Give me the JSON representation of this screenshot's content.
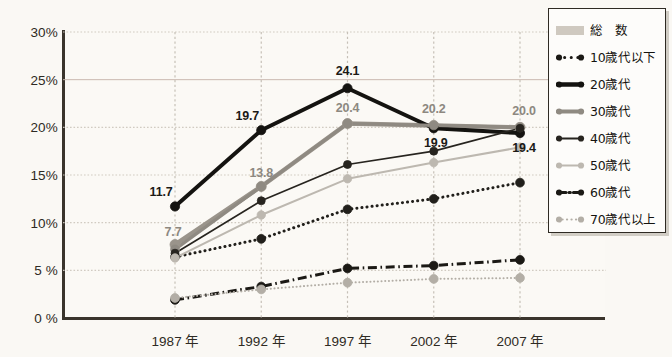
{
  "chart_data": {
    "type": "line",
    "title": "",
    "xlabel": "",
    "ylabel": "",
    "grid": true,
    "legend_position": "right",
    "categories": [
      "1987 年",
      "1992 年",
      "1997 年",
      "2002 年",
      "2007 年"
    ],
    "ylim": [
      0,
      30
    ],
    "yticks": [
      0,
      5,
      10,
      15,
      20,
      25,
      30
    ],
    "ytick_labels": [
      "0 %",
      "5 %",
      "10%",
      "15%",
      "20%",
      "25%",
      "30%"
    ],
    "series": [
      {
        "name": "総　数",
        "style": "solid-thick",
        "color": "#9a948b",
        "values": [
          7.7,
          13.8,
          20.4,
          20.2,
          20.0
        ],
        "labels": [
          {
            "index": 0,
            "text": "7.7",
            "tone": "gray"
          },
          {
            "index": 1,
            "text": "13.8",
            "tone": "gray"
          },
          {
            "index": 2,
            "text": "20.4",
            "tone": "gray"
          },
          {
            "index": 3,
            "text": "20.2",
            "tone": "gray"
          },
          {
            "index": 4,
            "text": "20.0",
            "tone": "gray"
          }
        ]
      },
      {
        "name": "10歳代以下",
        "style": "dotted",
        "color": "#211f1b",
        "values": [
          6.4,
          8.3,
          11.4,
          12.5,
          14.2
        ],
        "labels": []
      },
      {
        "name": "20歳代",
        "style": "solid-extra-thick",
        "color": "#141310",
        "values": [
          11.7,
          19.7,
          24.1,
          19.9,
          19.4
        ],
        "labels": [
          {
            "index": 0,
            "text": "11.7",
            "tone": "dark"
          },
          {
            "index": 1,
            "text": "19.7",
            "tone": "dark"
          },
          {
            "index": 2,
            "text": "24.1",
            "tone": "dark"
          },
          {
            "index": 3,
            "text": "19.9",
            "tone": "dark"
          },
          {
            "index": 4,
            "text": "19.4",
            "tone": "dark"
          }
        ]
      },
      {
        "name": "30歳代",
        "style": "solid-medium",
        "color": "#8f8a82",
        "values": [
          7.2,
          13.8,
          20.4,
          20.2,
          20.0
        ],
        "labels": []
      },
      {
        "name": "40歳代",
        "style": "solid-thin",
        "color": "#27241f",
        "values": [
          6.8,
          12.3,
          16.1,
          17.5,
          19.9
        ],
        "labels": []
      },
      {
        "name": "50歳代",
        "style": "solid-light",
        "color": "#bdb8b0",
        "values": [
          6.3,
          10.8,
          14.6,
          16.3,
          17.9
        ],
        "labels": []
      },
      {
        "name": "60歳代",
        "style": "dash-dot",
        "color": "#1b1915",
        "values": [
          1.9,
          3.3,
          5.2,
          5.5,
          6.1
        ],
        "labels": []
      },
      {
        "name": "70歳代以上",
        "style": "dotted-light",
        "color": "#b3aea6",
        "values": [
          2.1,
          3.0,
          3.7,
          4.1,
          4.2
        ],
        "labels": []
      }
    ]
  },
  "legend": {
    "items": [
      {
        "label": "総　数",
        "key": "band"
      },
      {
        "label": "10歳代以下",
        "key": "dotted-dark"
      },
      {
        "label": "20歳代",
        "key": "solid-extra-thick"
      },
      {
        "label": "30歳代",
        "key": "solid-medium-gray"
      },
      {
        "label": "40歳代",
        "key": "solid-thin-dark"
      },
      {
        "label": "50歳代",
        "key": "solid-light-gray"
      },
      {
        "label": "60歳代",
        "key": "dash-dot-dark"
      },
      {
        "label": "70歳代以上",
        "key": "dotted-light-gray"
      }
    ]
  },
  "colors": {
    "axis": "#3a342c",
    "grid": "#cfc9c0",
    "background": "#faf8f4",
    "dark": "#141310",
    "gray": "#9a948b"
  }
}
